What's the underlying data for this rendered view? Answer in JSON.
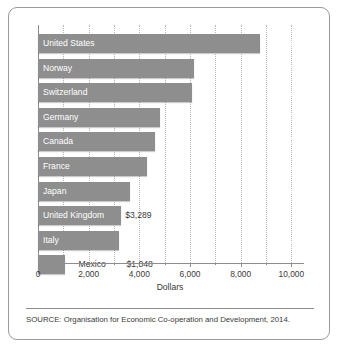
{
  "figure": {
    "source_note": "SOURCE: Organisation for Economic Co-operation and Development, 2014."
  },
  "chart_data": {
    "type": "bar",
    "orientation": "horizontal",
    "title": "",
    "xlabel": "Dollars",
    "ylabel": "",
    "xlim": [
      0,
      10500
    ],
    "grid": true,
    "gridlines_every": 1000,
    "legend": "none",
    "tick_labels": [
      "0",
      "2,000",
      "4,000",
      "6,000",
      "8,000",
      "10,000"
    ],
    "tick_values": [
      0,
      2000,
      4000,
      6000,
      8000,
      10000
    ],
    "categories": [
      "United States",
      "Norway",
      "Switzerland",
      "Germany",
      "Canada",
      "France",
      "Japan",
      "United Kingdom",
      "Italy",
      "Mexico"
    ],
    "values": [
      8745,
      6140,
      6080,
      4811,
      4602,
      4288,
      3649,
      3289,
      3209,
      1048
    ],
    "value_labels": [
      "$8,745",
      "$6,140",
      "$6,080",
      "$4,811",
      "$4,602",
      "$4,288",
      "$3,649",
      "$3,289",
      "$3,209",
      "$1,048"
    ],
    "bars": [
      {
        "category": "United States",
        "value": 8745,
        "value_label": "$8,745",
        "name_position": "inside",
        "value_position": "inside"
      },
      {
        "category": "Norway",
        "value": 6140,
        "value_label": "$6,140",
        "name_position": "inside",
        "value_position": "inside"
      },
      {
        "category": "Switzerland",
        "value": 6080,
        "value_label": "$6,080",
        "name_position": "inside",
        "value_position": "inside"
      },
      {
        "category": "Germany",
        "value": 4811,
        "value_label": "$4,811",
        "name_position": "inside",
        "value_position": "inside"
      },
      {
        "category": "Canada",
        "value": 4602,
        "value_label": "$4,602",
        "name_position": "inside",
        "value_position": "inside"
      },
      {
        "category": "France",
        "value": 4288,
        "value_label": "$4,288",
        "name_position": "inside",
        "value_position": "inside"
      },
      {
        "category": "Japan",
        "value": 3649,
        "value_label": "$3,649",
        "name_position": "inside",
        "value_position": "inside"
      },
      {
        "category": "United Kingdom",
        "value": 3289,
        "value_label": "$3,289",
        "name_position": "inside",
        "value_position": "outside"
      },
      {
        "category": "Italy",
        "value": 3209,
        "value_label": "$3,209",
        "name_position": "inside",
        "value_position": "inside"
      },
      {
        "category": "Mexico",
        "value": 1048,
        "value_label": "$1,048",
        "name_position": "outside",
        "value_position": "outside"
      }
    ],
    "colors": {
      "bar": "#8e8e8e",
      "bar_text": "#ffffff",
      "outside_text": "#3a3a3a",
      "gridline": "#b8b8b8",
      "axis": "#8d8d8d",
      "background": "#ffffff"
    }
  }
}
